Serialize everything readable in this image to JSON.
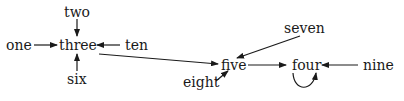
{
  "diagram": {
    "type": "directed-graph",
    "colors": {
      "text": "#1a1a1a",
      "edge": "#1a1a1a",
      "background": "#ffffff"
    },
    "nodes": {
      "one": "one",
      "two": "two",
      "three": "three",
      "six": "six",
      "ten": "ten",
      "five": "five",
      "seven": "seven",
      "eight": "eight",
      "four": "four",
      "nine": "nine"
    },
    "edges": [
      {
        "from": "one",
        "to": "three"
      },
      {
        "from": "two",
        "to": "three"
      },
      {
        "from": "six",
        "to": "three"
      },
      {
        "from": "ten",
        "to": "three"
      },
      {
        "from": "three",
        "to": "five"
      },
      {
        "from": "seven",
        "to": "five"
      },
      {
        "from": "eight",
        "to": "five"
      },
      {
        "from": "five",
        "to": "four"
      },
      {
        "from": "nine",
        "to": "four"
      },
      {
        "from": "four",
        "to": "four"
      }
    ]
  }
}
